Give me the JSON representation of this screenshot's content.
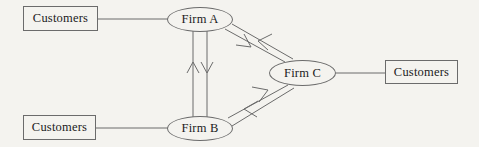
{
  "diagram": {
    "background_color": "#f4f3ef",
    "line_color": "#6b6b6b",
    "text_color": "#1c1c1c",
    "nodes": [
      {
        "id": "customers-top-left",
        "label": "Customers",
        "shape": "rect",
        "x": 23,
        "y": 6,
        "w": 75,
        "h": 25
      },
      {
        "id": "firm-a",
        "label": "Firm A",
        "shape": "ellipse",
        "x": 167,
        "y": 7,
        "w": 66,
        "h": 25
      },
      {
        "id": "firm-c",
        "label": "Firm C",
        "shape": "ellipse",
        "x": 269,
        "y": 60,
        "w": 67,
        "h": 26
      },
      {
        "id": "customers-right",
        "label": "Customers",
        "shape": "rect",
        "x": 385,
        "y": 60,
        "w": 73,
        "h": 24
      },
      {
        "id": "customers-bottom-left",
        "label": "Customers",
        "shape": "rect",
        "x": 23,
        "y": 115,
        "w": 73,
        "h": 25
      },
      {
        "id": "firm-b",
        "label": "Firm B",
        "shape": "ellipse",
        "x": 167,
        "y": 116,
        "w": 66,
        "h": 25
      }
    ],
    "edges": [
      {
        "id": "edge-customers-top-left-to-firm-a",
        "from": "customers-top-left",
        "to": "firm-a",
        "arrow": "none"
      },
      {
        "id": "edge-customers-bottom-left-to-firm-b",
        "from": "customers-bottom-left",
        "to": "firm-b",
        "arrow": "none"
      },
      {
        "id": "edge-firm-c-to-customers-right",
        "from": "firm-c",
        "to": "customers-right",
        "arrow": "none"
      },
      {
        "id": "edge-firm-b-to-firm-a",
        "from": "firm-b",
        "to": "firm-a",
        "arrow": "up"
      },
      {
        "id": "edge-firm-a-to-firm-b",
        "from": "firm-a",
        "to": "firm-b",
        "arrow": "down"
      },
      {
        "id": "edge-firm-a-to-firm-c",
        "from": "firm-a",
        "to": "firm-c",
        "arrow": "down-right"
      },
      {
        "id": "edge-firm-c-to-firm-a",
        "from": "firm-c",
        "to": "firm-a",
        "arrow": "up-left"
      },
      {
        "id": "edge-firm-b-to-firm-c",
        "from": "firm-b",
        "to": "firm-c",
        "arrow": "up-right"
      },
      {
        "id": "edge-firm-c-to-firm-b",
        "from": "firm-c",
        "to": "firm-b",
        "arrow": "down-left"
      }
    ]
  }
}
